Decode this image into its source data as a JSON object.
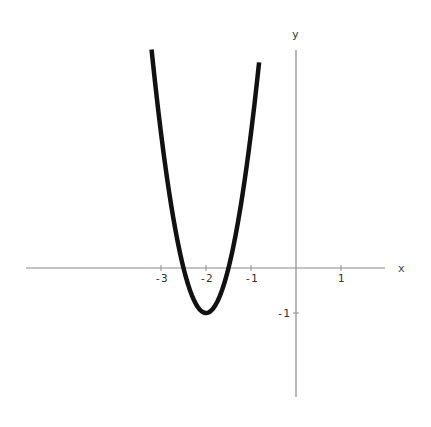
{
  "chart_data": {
    "type": "line",
    "title": "",
    "function": "y = 4x^2 + 16x + 15",
    "xlabel": "x",
    "ylabel": "y",
    "xlim": [
      -6,
      2
    ],
    "ylim": [
      -2.9,
      4.85
    ],
    "x_ticks": [
      -3,
      -2,
      -1,
      1
    ],
    "x_tick_labels": [
      "-3",
      "-2",
      "-1",
      "1"
    ],
    "y_ticks": [
      -1
    ],
    "y_tick_labels": [
      "-1"
    ],
    "grid": false,
    "legend": null,
    "series": [
      {
        "name": "parabola",
        "color": "#111111",
        "x": [
          -3.21,
          -3.0,
          -2.75,
          -2.5,
          -2.25,
          -2.0,
          -1.75,
          -1.5,
          -1.25,
          -1.0,
          -0.82
        ],
        "values": [
          4.86,
          3.0,
          1.25,
          0.0,
          -0.75,
          -1.0,
          -0.75,
          0.0,
          1.25,
          3.0,
          4.57
        ]
      }
    ],
    "vertex": [
      -2,
      -1
    ],
    "roots": [
      -2.5,
      -1.5
    ]
  },
  "axes": {
    "x_label": "x",
    "y_label": "y",
    "axis_color": "#8a8a8a",
    "curve_color": "#111111"
  }
}
